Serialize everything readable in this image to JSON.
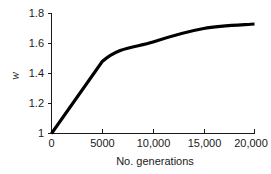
{
  "chart_data": {
    "type": "line",
    "title": "",
    "xlabel": "No. generations",
    "ylabel": "w",
    "xlim": [
      0,
      20000
    ],
    "ylim": [
      1.0,
      1.8
    ],
    "grid": false,
    "legend": false,
    "x": [
      0,
      5000,
      10000,
      15000,
      20000
    ],
    "values": [
      1.0,
      1.48,
      1.61,
      1.7,
      1.73
    ],
    "series": [
      {
        "name": "mean fitness",
        "color": "#000000",
        "x": [
          0,
          5000,
          10000,
          15000,
          20000
        ],
        "values": [
          1.0,
          1.48,
          1.61,
          1.7,
          1.73
        ]
      }
    ],
    "x_tick_values": [
      0,
      5000,
      10000,
      15000,
      20000
    ],
    "x_tick_labels": [
      "0",
      "5000",
      "10,000",
      "15,000",
      "20,000"
    ],
    "y_tick_values": [
      1.0,
      1.2,
      1.4,
      1.6,
      1.8
    ],
    "y_tick_labels": [
      "1",
      "1.2",
      "1.4",
      "1.6",
      "1.8"
    ]
  },
  "axes": {
    "x_title": "No. generations",
    "y_title": "w"
  },
  "ticks": {
    "x": [
      {
        "label": "0"
      },
      {
        "label": "5000"
      },
      {
        "label": "10,000"
      },
      {
        "label": "15,000"
      },
      {
        "label": "20,000"
      }
    ],
    "y": [
      {
        "label": "1.8"
      },
      {
        "label": "1.6"
      },
      {
        "label": "1.4"
      },
      {
        "label": "1.2"
      },
      {
        "label": "1"
      }
    ]
  },
  "colors": {
    "line": "#000000",
    "axis": "#1a1a1a",
    "background": "#ffffff"
  }
}
